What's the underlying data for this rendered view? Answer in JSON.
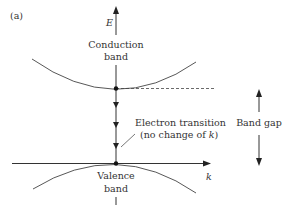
{
  "figure": {
    "panel_label": "(a)",
    "axes": {
      "energy_axis_label": "E",
      "momentum_axis_label": "k"
    },
    "conduction_band": {
      "label_line1": "Conduction",
      "label_line2": "band"
    },
    "valence_band": {
      "label_line1": "Valence",
      "label_line2": "band"
    },
    "transition": {
      "label_line1": "Electron transition",
      "label_line2_prefix": "(no change of ",
      "label_line2_var": "k",
      "label_line2_suffix": ")"
    },
    "band_gap": {
      "label": "Band gap"
    },
    "colors": {
      "line": "#333333",
      "background": "#ffffff"
    }
  }
}
